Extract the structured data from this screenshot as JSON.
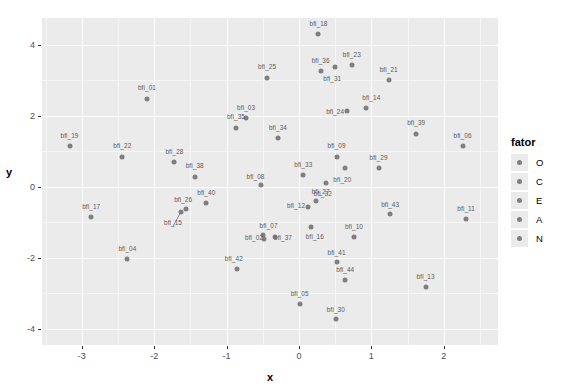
{
  "chart_data": {
    "type": "scatter",
    "title": "",
    "xlabel": "x",
    "ylabel": "y",
    "xlim": [
      -3.55,
      2.75
    ],
    "ylim": [
      -4.45,
      4.75
    ],
    "xticks": [
      "-3",
      "-2",
      "-1",
      "0",
      "1",
      "2"
    ],
    "xtick_values": [
      -3,
      -2,
      -1,
      0,
      1,
      2
    ],
    "yticks": [
      "4",
      "2",
      "0",
      "-2",
      "-4"
    ],
    "ytick_values": [
      4,
      2,
      0,
      -2,
      -4
    ],
    "grid": true,
    "legend_position": "right",
    "point_color": "#7f7f7f",
    "panel_background": "#ebebeb",
    "gridline_color": "#ffffff",
    "legend": {
      "title": "fator",
      "entries": [
        {
          "label": "O",
          "color": "#7f7f7f"
        },
        {
          "label": "C",
          "color": "#7f7f7f"
        },
        {
          "label": "E",
          "color": "#7f7f7f"
        },
        {
          "label": "A",
          "color": "#7f7f7f"
        },
        {
          "label": "N",
          "color": "#7f7f7f"
        }
      ]
    },
    "points": [
      {
        "label": "bfi_18",
        "x": 0.27,
        "y": 4.3,
        "lx": 0.27,
        "ly": 4.62
      },
      {
        "label": "bfi_23",
        "x": 0.73,
        "y": 3.42,
        "lx": 0.73,
        "ly": 3.74
      },
      {
        "label": "bfi_36",
        "x": 0.3,
        "y": 3.25,
        "lx": 0.3,
        "ly": 3.57
      },
      {
        "label": "bfi_31",
        "x": 0.5,
        "y": 3.37,
        "lx": 0.46,
        "ly": 3.06
      },
      {
        "label": "bfi_25",
        "x": -0.44,
        "y": 3.07,
        "lx": -0.44,
        "ly": 3.4
      },
      {
        "label": "bfi_21",
        "x": 1.24,
        "y": 3.0,
        "lx": 1.24,
        "ly": 3.32
      },
      {
        "label": "bfi_01",
        "x": -2.1,
        "y": 2.47,
        "lx": -2.1,
        "ly": 2.8
      },
      {
        "label": "bfi_14",
        "x": 0.92,
        "y": 2.22,
        "lx": 1.0,
        "ly": 2.52
      },
      {
        "label": "bfi_24",
        "x": 0.66,
        "y": 2.12,
        "lx": 0.5,
        "ly": 2.12
      },
      {
        "label": "bfi_03",
        "x": -0.73,
        "y": 1.94,
        "lx": -0.73,
        "ly": 2.26
      },
      {
        "label": "bfi_35",
        "x": -0.87,
        "y": 1.66,
        "lx": -0.87,
        "ly": 1.98
      },
      {
        "label": "bfi_39",
        "x": 1.62,
        "y": 1.5,
        "lx": 1.62,
        "ly": 1.82
      },
      {
        "label": "bfi_34",
        "x": -0.29,
        "y": 1.36,
        "lx": -0.29,
        "ly": 1.68
      },
      {
        "label": "bfi_19",
        "x": -3.17,
        "y": 1.15,
        "lx": -3.17,
        "ly": 1.47
      },
      {
        "label": "bfi_06",
        "x": 2.26,
        "y": 1.15,
        "lx": 2.26,
        "ly": 1.47
      },
      {
        "label": "bfi_22",
        "x": -2.44,
        "y": 0.85,
        "lx": -2.44,
        "ly": 1.17
      },
      {
        "label": "bfi_09",
        "x": 0.52,
        "y": 0.85,
        "lx": 0.52,
        "ly": 1.17
      },
      {
        "label": "bfi_28",
        "x": -1.72,
        "y": 0.69,
        "lx": -1.72,
        "ly": 1.01
      },
      {
        "label": "bfi_20",
        "x": 0.63,
        "y": 0.54,
        "lx": 0.6,
        "ly": 0.23
      },
      {
        "label": "bfi_29",
        "x": 1.1,
        "y": 0.52,
        "lx": 1.1,
        "ly": 0.84
      },
      {
        "label": "bfi_33",
        "x": 0.06,
        "y": 0.33,
        "lx": 0.06,
        "ly": 0.65
      },
      {
        "label": "bfi_38",
        "x": -1.44,
        "y": 0.29,
        "lx": -1.44,
        "ly": 0.61
      },
      {
        "label": "bfi_08",
        "x": -0.53,
        "y": 0.04,
        "lx": -0.6,
        "ly": 0.3
      },
      {
        "label": "bfi_32",
        "x": 0.38,
        "y": 0.12,
        "lx": 0.33,
        "ly": -0.17
      },
      {
        "label": "bfi_27",
        "x": 0.24,
        "y": -0.41,
        "lx": 0.3,
        "ly": -0.11
      },
      {
        "label": "bfi_40",
        "x": -1.28,
        "y": -0.46,
        "lx": -1.28,
        "ly": -0.15
      },
      {
        "label": "bfi_26",
        "x": -1.56,
        "y": -0.62,
        "lx": -1.6,
        "ly": -0.34
      },
      {
        "label": "bfi_12",
        "x": 0.13,
        "y": -0.57,
        "lx": -0.04,
        "ly": -0.51
      },
      {
        "label": "bfi_43",
        "x": 1.26,
        "y": -0.77,
        "lx": 1.26,
        "ly": -0.47
      },
      {
        "label": "bfi_11",
        "x": 2.31,
        "y": -0.9,
        "lx": 2.31,
        "ly": -0.59
      },
      {
        "label": "bfi_17",
        "x": -2.87,
        "y": -0.84,
        "lx": -2.87,
        "ly": -0.53
      },
      {
        "label": "bfi_15",
        "x": -1.63,
        "y": -0.7,
        "lx": -1.74,
        "ly": -1.0
      },
      {
        "label": "bfi_16",
        "x": 0.17,
        "y": -1.12,
        "lx": 0.22,
        "ly": -1.38
      },
      {
        "label": "bfi_07",
        "x": -0.49,
        "y": -1.36,
        "lx": -0.42,
        "ly": -1.08
      },
      {
        "label": "bfi_10",
        "x": 0.76,
        "y": -1.41,
        "lx": 0.76,
        "ly": -1.1
      },
      {
        "label": "bfi_37",
        "x": -0.33,
        "y": -1.41,
        "lx": -0.22,
        "ly": -1.4
      },
      {
        "label": "bfi_02",
        "x": -0.48,
        "y": -1.47,
        "lx": -0.62,
        "ly": -1.4
      },
      {
        "label": "bfi_04",
        "x": -2.37,
        "y": -2.02,
        "lx": -2.37,
        "ly": -1.72
      },
      {
        "label": "bfi_41",
        "x": 0.52,
        "y": -2.12,
        "lx": 0.52,
        "ly": -1.82
      },
      {
        "label": "bfi_42",
        "x": -0.86,
        "y": -2.3,
        "lx": -0.9,
        "ly": -2.0
      },
      {
        "label": "bfi_44",
        "x": 0.64,
        "y": -2.61,
        "lx": 0.64,
        "ly": -2.31
      },
      {
        "label": "bfi_13",
        "x": 1.75,
        "y": -2.81,
        "lx": 1.75,
        "ly": -2.51
      },
      {
        "label": "bfi_05",
        "x": 0.01,
        "y": -3.3,
        "lx": 0.01,
        "ly": -3.0
      },
      {
        "label": "bfi_30",
        "x": 0.51,
        "y": -3.73,
        "lx": 0.51,
        "ly": -3.43
      }
    ]
  }
}
